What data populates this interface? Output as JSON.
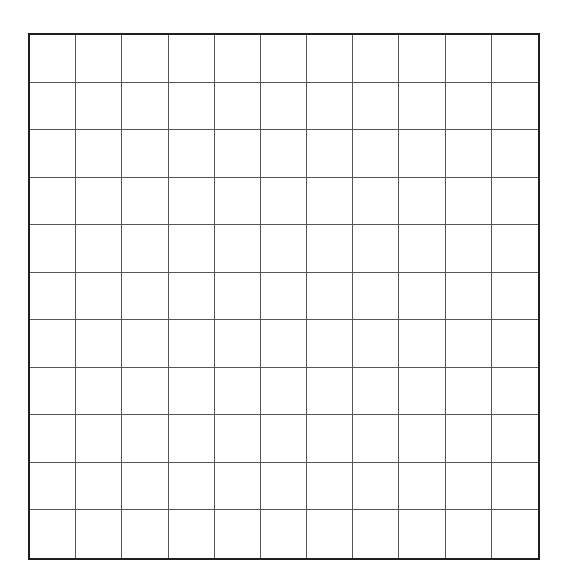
{
  "grid": {
    "rows": 11,
    "columns": 11,
    "line_color": "#555555",
    "border_color": "#1e1e1e",
    "background_color": "#ffffff"
  }
}
